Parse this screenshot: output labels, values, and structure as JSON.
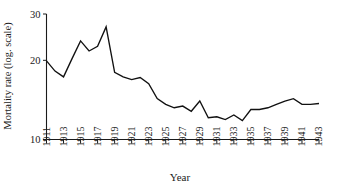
{
  "chart_data": {
    "type": "line",
    "title": "",
    "xlabel": "Year",
    "ylabel": "Mortality rate (log. scale)",
    "y_scale": "log",
    "ylim": [
      10,
      30
    ],
    "xlim": [
      1911,
      1943
    ],
    "grid": false,
    "legend": null,
    "ytick_labels": [
      "30",
      "20",
      "10"
    ],
    "ytick_values": [
      30,
      20,
      10
    ],
    "xtick_labels": [
      "1911",
      "1913",
      "1915",
      "1917",
      "1919",
      "1921",
      "1923",
      "1925",
      "1927",
      "1929",
      "1931",
      "1933",
      "1935",
      "1937",
      "1939",
      "1941",
      "1943"
    ],
    "xtick_values": [
      1911,
      1913,
      1915,
      1917,
      1919,
      1921,
      1923,
      1925,
      1927,
      1929,
      1931,
      1933,
      1935,
      1937,
      1939,
      1941,
      1943
    ],
    "x": [
      1911,
      1912,
      1913,
      1914,
      1915,
      1916,
      1917,
      1918,
      1919,
      1920,
      1921,
      1922,
      1923,
      1924,
      1925,
      1926,
      1927,
      1928,
      1929,
      1930,
      1931,
      1932,
      1933,
      1934,
      1935,
      1936,
      1937,
      1938,
      1939,
      1940,
      1941,
      1942,
      1943
    ],
    "values": [
      19.9,
      18.2,
      17.3,
      20.3,
      23.7,
      21.7,
      22.6,
      26.8,
      18.0,
      17.3,
      16.9,
      17.2,
      16.3,
      14.3,
      13.6,
      13.2,
      13.4,
      12.8,
      14.0,
      12.1,
      12.2,
      11.9,
      12.4,
      11.8,
      13.0,
      13.0,
      13.2,
      13.6,
      14.0,
      14.3,
      13.6,
      13.6,
      13.7
    ],
    "line_color": "#111111",
    "series_name": "Mortality rate"
  },
  "axes": {
    "x_axis_name": "year-axis",
    "y_axis_name": "mortality-axis"
  }
}
